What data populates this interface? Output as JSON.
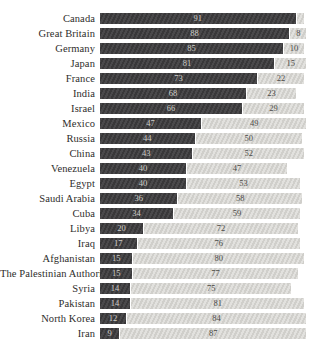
{
  "chart_data": {
    "type": "bar",
    "orientation": "horizontal",
    "stacked": true,
    "title": "",
    "xlabel": "",
    "ylabel": "",
    "xlim": [
      0,
      100
    ],
    "grid": false,
    "legend": "none",
    "categories": [
      "Canada",
      "Great Britain",
      "Germany",
      "Japan",
      "France",
      "India",
      "Israel",
      "Mexico",
      "Russia",
      "China",
      "Venezuela",
      "Egypt",
      "Saudi Arabia",
      "Cuba",
      "Libya",
      "Iraq",
      "Afghanistan",
      "The Palestinian Authority",
      "Syria",
      "Pakistan",
      "North Korea",
      "Iran"
    ],
    "series": [
      {
        "name": "dark_segment",
        "color": "#3f3e40",
        "values": [
          91,
          88,
          85,
          81,
          73,
          68,
          66,
          47,
          44,
          43,
          40,
          40,
          36,
          34,
          20,
          17,
          15,
          15,
          14,
          14,
          12,
          9
        ],
        "labels": [
          "91",
          "88",
          "85",
          "81",
          "73",
          "68",
          "66",
          "47",
          "44",
          "43",
          "40",
          "40",
          "36",
          "34",
          "20",
          "17",
          "15",
          "15",
          "14",
          "14",
          "12",
          "9"
        ]
      },
      {
        "name": "light_segment",
        "color": "#d8d7d3",
        "values": [
          4,
          8,
          10,
          15,
          22,
          23,
          29,
          49,
          50,
          52,
          47,
          53,
          58,
          59,
          72,
          76,
          80,
          77,
          75,
          81,
          84,
          87
        ],
        "labels": [
          "",
          "8",
          "10",
          "15",
          "22",
          "23",
          "29",
          "49",
          "50",
          "52",
          "47",
          "53",
          "58",
          "59",
          "72",
          "76",
          "80",
          "77",
          "75",
          "81",
          "84",
          "87"
        ]
      }
    ]
  },
  "colors": {
    "background": "#ffffff",
    "dark_bar": "#3f3e40",
    "light_bar": "#d8d7d3",
    "dark_bar_value_text": "#cfcec9",
    "light_bar_value_text": "#4b4a47",
    "category_label_text": "#2e2d2b"
  }
}
